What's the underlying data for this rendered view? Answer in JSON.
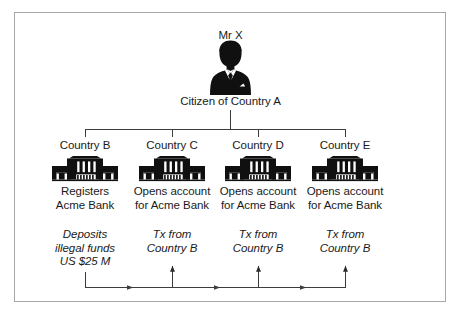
{
  "diagram": {
    "title_person": "Mr X",
    "caption_person": "Citizen of Country A",
    "person_icon": "businessman-silhouette-icon",
    "frame_color": "#a7a7a7",
    "ink_color": "#1a1a1a",
    "branches": [
      {
        "country_label": "Country B",
        "bank_icon": "bank-building-icon",
        "action": "Registers\nAcme Bank",
        "note": "Deposits\nillegal funds\nUS $25 M",
        "flow_role": "source"
      },
      {
        "country_label": "Country C",
        "bank_icon": "bank-building-icon",
        "action": "Opens account\nfor Acme Bank",
        "note": "Tx from\nCountry B",
        "flow_role": "destination"
      },
      {
        "country_label": "Country D",
        "bank_icon": "bank-building-icon",
        "action": "Opens account\nfor Acme Bank",
        "note": "Tx from\nCountry B",
        "flow_role": "destination"
      },
      {
        "country_label": "Country E",
        "bank_icon": "bank-building-icon",
        "action": "Opens account\nfor Acme Bank",
        "note": "Tx from\nCountry B",
        "flow_role": "destination"
      }
    ],
    "connectors": {
      "tree_label": "hierarchy-connector",
      "flow_label": "money-flow-connector",
      "flow_direction": "left-to-right"
    }
  }
}
